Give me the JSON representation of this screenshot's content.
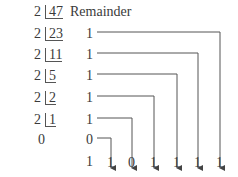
{
  "header": {
    "remainder_label": "Remainder"
  },
  "divisions": [
    {
      "divisor": "2",
      "dividend": "47",
      "remainder": "1"
    },
    {
      "divisor": "2",
      "dividend": "23",
      "remainder": "1"
    },
    {
      "divisor": "2",
      "dividend": "11",
      "remainder": "1"
    },
    {
      "divisor": "2",
      "dividend": "5",
      "remainder": "1"
    },
    {
      "divisor": "2",
      "dividend": "2",
      "remainder": "1"
    },
    {
      "divisor": "2",
      "dividend": "1",
      "remainder": "0"
    }
  ],
  "final": {
    "quotient": "0",
    "remainder": "1"
  },
  "result_bits": [
    "1",
    "0",
    "1",
    "1",
    "1",
    "1"
  ],
  "colors": {
    "text": "#3a3a3a",
    "lines": "#555555"
  }
}
